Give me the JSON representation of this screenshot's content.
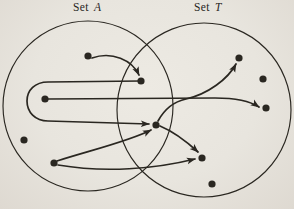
{
  "figure": {
    "canvas": {
      "width": 294,
      "height": 209
    },
    "colors": {
      "background": "#e8e5de",
      "ink": "#2a2721"
    },
    "labels": {
      "left": {
        "word": "Set",
        "letter": "A"
      },
      "right": {
        "word": "Set",
        "letter": "T"
      }
    },
    "sets": [
      {
        "id": "A",
        "name": "Set A",
        "cx": 88,
        "cy": 106,
        "r": 85
      },
      {
        "id": "T",
        "name": "Set T",
        "cx": 204,
        "cy": 110,
        "r": 87
      }
    ],
    "dot_radius": 3.6,
    "dots": [
      {
        "id": "a1",
        "set": "A",
        "x": 88,
        "y": 56
      },
      {
        "id": "a2",
        "set": "A",
        "x": 45,
        "y": 99
      },
      {
        "id": "a3",
        "set": "A",
        "x": 24,
        "y": 140
      },
      {
        "id": "a4",
        "set": "A",
        "x": 54,
        "y": 163
      },
      {
        "id": "o1",
        "set": "A∩T",
        "x": 141,
        "y": 81
      },
      {
        "id": "o2",
        "set": "A∩T",
        "x": 156,
        "y": 125
      },
      {
        "id": "t1",
        "set": "T",
        "x": 239,
        "y": 58
      },
      {
        "id": "t2",
        "set": "T",
        "x": 263,
        "y": 79
      },
      {
        "id": "t3",
        "set": "T",
        "x": 266,
        "y": 108
      },
      {
        "id": "t4",
        "set": "T",
        "x": 202,
        "y": 158
      },
      {
        "id": "t5",
        "set": "T",
        "x": 212,
        "y": 184
      }
    ],
    "arrows": [
      {
        "from": "a1",
        "to": "o1",
        "path": "M 92,58 C 112,51 132,60 139,75"
      },
      {
        "from": "o1",
        "to": "o2",
        "path": "M 141,81 L 48,82 C 35,82 27,90 27,101 C 27,112 35,121 48,121 L 149,124"
      },
      {
        "from": "a2",
        "to": "t3",
        "path": "M 48,99 L 215,98 C 235,98 250,101 259,107"
      },
      {
        "from": "a4",
        "to": "o2",
        "path": "M 57,161 C 88,151 130,141 151,130"
      },
      {
        "from": "a4",
        "to": "t4",
        "path": "M 58,165 C 105,173 155,169 195,159"
      },
      {
        "from": "o2",
        "to": "t1",
        "path": "M 158,121 C 164,110 172,102 186,99 C 208,94 228,79 236,64"
      },
      {
        "from": "o2",
        "to": "t4",
        "path": "M 160,126 C 172,131 186,141 198,152"
      }
    ]
  }
}
